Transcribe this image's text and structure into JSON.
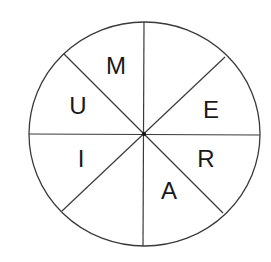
{
  "diagram": {
    "type": "letter-wheel",
    "colors": {
      "background": "#ffffff",
      "stroke": "#3a3a3a",
      "text": "#1a1a1a",
      "hub": "#111111"
    },
    "circle": {
      "cx": 144.5,
      "cy": 134,
      "rx": 115.5,
      "ry": 112
    },
    "dividers": [
      {
        "name": "vertical-divider",
        "x1": 144,
        "y1": 22,
        "x2": 143,
        "y2": 246
      },
      {
        "name": "horizontal-divider",
        "x1": 29,
        "y1": 134,
        "x2": 260,
        "y2": 135
      },
      {
        "name": "diagonal-divider-nw-se",
        "x1": 64,
        "y1": 54,
        "x2": 223,
        "y2": 213
      },
      {
        "name": "diagonal-divider-ne-sw",
        "x1": 225,
        "y1": 57,
        "x2": 62,
        "y2": 211
      }
    ],
    "sectors": [
      {
        "position": "top-right-upper",
        "letter": ""
      },
      {
        "position": "right-upper",
        "letter": "E",
        "x": 211,
        "y": 109
      },
      {
        "position": "right-lower",
        "letter": "R",
        "x": 206,
        "y": 158
      },
      {
        "position": "bottom-right",
        "letter": "A",
        "x": 169,
        "y": 190
      },
      {
        "position": "bottom-left",
        "letter": ""
      },
      {
        "position": "left-lower",
        "letter": "I",
        "x": 81,
        "y": 158
      },
      {
        "position": "left-upper",
        "letter": "U",
        "x": 78,
        "y": 105
      },
      {
        "position": "top-left",
        "letter": "M",
        "x": 116,
        "y": 65
      }
    ]
  }
}
